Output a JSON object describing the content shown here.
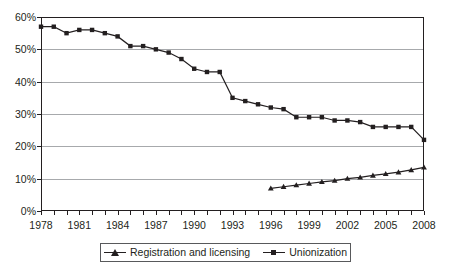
{
  "chart_data": {
    "type": "line",
    "title": "",
    "xlabel": "",
    "ylabel": "",
    "xlim": [
      1978,
      2008
    ],
    "ylim": [
      0,
      60
    ],
    "grid": true,
    "legend_position": "bottom",
    "x": [
      1978,
      1979,
      1980,
      1981,
      1982,
      1983,
      1984,
      1985,
      1986,
      1987,
      1988,
      1989,
      1990,
      1991,
      1992,
      1993,
      1994,
      1995,
      1996,
      1997,
      1998,
      1999,
      2000,
      2001,
      2002,
      2003,
      2004,
      2005,
      2006,
      2007,
      2008
    ],
    "y_tick_labels": [
      "0%",
      "10%",
      "20%",
      "30%",
      "40%",
      "50%",
      "60%"
    ],
    "y_tick_values": [
      0,
      10,
      20,
      30,
      40,
      50,
      60
    ],
    "x_tick_labels": [
      "1978",
      "1981",
      "1984",
      "1987",
      "1990",
      "1993",
      "1996",
      "1999",
      "2002",
      "2005",
      "2008"
    ],
    "x_tick_values": [
      1978,
      1981,
      1984,
      1987,
      1990,
      1993,
      1996,
      1999,
      2002,
      2005,
      2008
    ],
    "series": [
      {
        "name": "Unionization",
        "marker": "square",
        "color": "#231f20",
        "x": [
          1978,
          1979,
          1980,
          1981,
          1982,
          1983,
          1984,
          1985,
          1986,
          1987,
          1988,
          1989,
          1990,
          1991,
          1992,
          1993,
          1994,
          1995,
          1996,
          1997,
          1998,
          1999,
          2000,
          2001,
          2002,
          2003,
          2004,
          2005,
          2006,
          2007,
          2008
        ],
        "values": [
          57,
          57,
          55,
          56,
          56,
          55,
          54,
          51,
          51,
          50,
          49,
          47,
          44,
          43,
          43,
          35,
          34,
          33,
          32,
          31.5,
          29,
          29,
          29,
          28,
          28,
          27.5,
          26,
          26,
          26,
          26,
          22
        ]
      },
      {
        "name": "Registration and licensing",
        "marker": "triangle",
        "color": "#231f20",
        "x": [
          1996,
          1997,
          1998,
          1999,
          2000,
          2001,
          2002,
          2003,
          2004,
          2005,
          2006,
          2007,
          2008
        ],
        "values": [
          7,
          7.5,
          8,
          8.5,
          9,
          9.4,
          10,
          10.4,
          11,
          11.5,
          12,
          12.7,
          13.5
        ]
      }
    ]
  },
  "legend": {
    "entries": [
      {
        "label": "Registration and licensing",
        "marker": "triangle-marker"
      },
      {
        "label": "Unionization",
        "marker": "square-marker"
      }
    ]
  }
}
